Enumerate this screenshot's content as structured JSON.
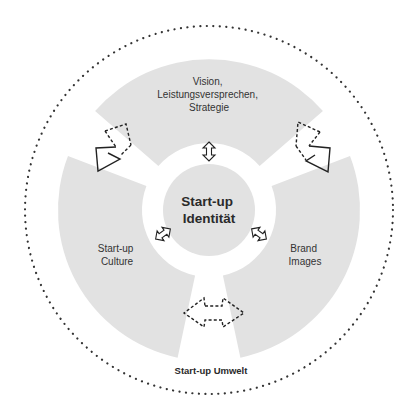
{
  "diagram": {
    "center": {
      "line1": "Start-up",
      "line2": "Identität"
    },
    "sectors": [
      {
        "id": "top",
        "lines": [
          "Vision,",
          "Leistungsversprechen,",
          "Strategie"
        ]
      },
      {
        "id": "left",
        "lines": [
          "Start-up",
          "Culture"
        ]
      },
      {
        "id": "right",
        "lines": [
          "Brand",
          "Images"
        ]
      }
    ],
    "environment_label": "Start-up Umwelt",
    "colors": {
      "sector_fill": "#e2e2e2",
      "center_fill": "#e2e2e2",
      "outline": "#333333",
      "dotted_circle": "#333333"
    },
    "arrows": [
      {
        "id": "top-to-left",
        "style": "dashed-to-solid",
        "direction": "top sector to left sector"
      },
      {
        "id": "top-to-right",
        "style": "dashed-to-solid",
        "direction": "top sector to right sector"
      },
      {
        "id": "left-right",
        "style": "dashed-double",
        "direction": "left sector and right sector"
      },
      {
        "id": "center-top",
        "style": "solid-double-small"
      },
      {
        "id": "center-left",
        "style": "solid-double-small"
      },
      {
        "id": "center-right",
        "style": "solid-double-small"
      }
    ]
  }
}
